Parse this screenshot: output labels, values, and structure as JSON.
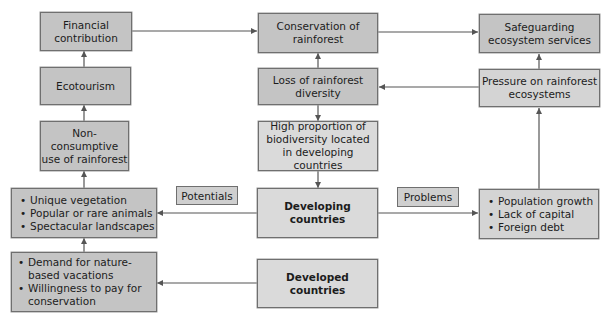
{
  "diagram": {
    "nodes": {
      "financial": "Financial contribution",
      "conservation": "Conservation of rainforest",
      "safeguarding": "Safeguarding ecosystem services",
      "ecotourism": "Ecotourism",
      "loss": "Loss of rainforest diversity",
      "pressure": "Pressure on rainforest ecosystems",
      "non_consumptive": "Non-consumptive use of rainforest",
      "high_proportion": "High proportion of biodiversity located in developing countries",
      "developing": "Developing countries",
      "developed": "Developed countries"
    },
    "lists": {
      "potentials_items": [
        "Unique vegetation",
        "Popular or rare animals",
        "Spectacular landscapes"
      ],
      "demand_items": [
        "Demand for nature-based vacations",
        "Willingness to pay for conservation"
      ],
      "problems_items": [
        "Population growth",
        "Lack of capital",
        "Foreign debt"
      ]
    },
    "labels": {
      "potentials": "Potentials",
      "problems": "Problems"
    },
    "edges": [
      {
        "from": "financial",
        "to": "conservation"
      },
      {
        "from": "conservation",
        "to": "safeguarding"
      },
      {
        "from": "ecotourism",
        "to": "financial"
      },
      {
        "from": "non_consumptive",
        "to": "ecotourism"
      },
      {
        "from": "potentials_list",
        "to": "non_consumptive"
      },
      {
        "from": "demand_list",
        "to": "potentials_list"
      },
      {
        "from": "developing",
        "to": "potentials_list",
        "label": "Potentials"
      },
      {
        "from": "developed",
        "to": "demand_list"
      },
      {
        "from": "loss",
        "to": "conservation"
      },
      {
        "from": "loss",
        "to": "high_proportion"
      },
      {
        "from": "high_proportion",
        "to": "developing"
      },
      {
        "from": "pressure",
        "to": "loss"
      },
      {
        "from": "pressure",
        "to": "safeguarding"
      },
      {
        "from": "problems_list",
        "to": "pressure"
      },
      {
        "from": "developing",
        "to": "problems_list",
        "label": "Problems"
      }
    ],
    "colors": {
      "box_dark": "#c4c4c4",
      "box_light": "#d4d4d4",
      "line": "#555555"
    }
  }
}
